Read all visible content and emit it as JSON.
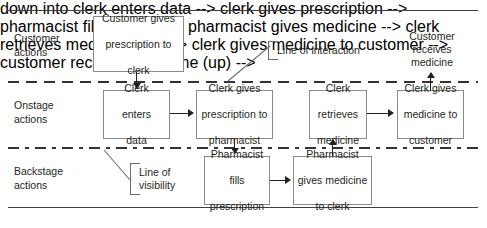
{
  "diagram": {
    "type": "service-blueprint"
  },
  "lanes": [
    {
      "id": "customer",
      "label": "Customer\nactions"
    },
    {
      "id": "onstage",
      "label": "Onstage\nactions"
    },
    {
      "id": "backstage",
      "label": "Backstage\nactions"
    }
  ],
  "lane_labels": {
    "customer_line1": "Customer",
    "customer_line2": "actions",
    "onstage_line1": "Onstage",
    "onstage_line2": "actions",
    "backstage_line1": "Backstage",
    "backstage_line2": "actions"
  },
  "dividers": [
    {
      "id": "line-interaction",
      "style": "dashed",
      "callout": "Line of interaction"
    },
    {
      "id": "line-visibility",
      "style": "dash-dot",
      "callout": "Line of visibility"
    }
  ],
  "callouts": {
    "interaction_line1": "Line of interaction",
    "visibility_line1": "Line of",
    "visibility_line2": "visibility"
  },
  "nodes": {
    "customer_gives": {
      "line1": "Customer gives",
      "line2": "prescription to",
      "line3": "clerk"
    },
    "customer_receives": {
      "line1": "Customer",
      "line2": "receives",
      "line3": "medicine"
    },
    "clerk_enters": {
      "line1": "Clerk",
      "line2": "enters",
      "line3": "data"
    },
    "clerk_gives_rx": {
      "line1": "Clerk gives",
      "line2": "prescription to",
      "line3": "pharmacist"
    },
    "clerk_retrieves": {
      "line1": "Clerk",
      "line2": "retrieves",
      "line3": "medicine"
    },
    "clerk_gives_medicine": {
      "line1": "Clerk gives",
      "line2": "medicine to",
      "line3": "customer"
    },
    "pharmacist_fills": {
      "line1": "Pharmacist",
      "line2": "fills",
      "line3": "prescription"
    },
    "pharmacist_gives": {
      "line1": "Pharmacist",
      "line2": "gives medicine",
      "line3": "to clerk"
    }
  },
  "colors": {
    "box_border": "#8a8a8a",
    "frame_rule": "#3f3f3f",
    "divider": "#333333",
    "text": "#231f20",
    "arrow": "#231f20",
    "background": "#ffffff"
  }
}
